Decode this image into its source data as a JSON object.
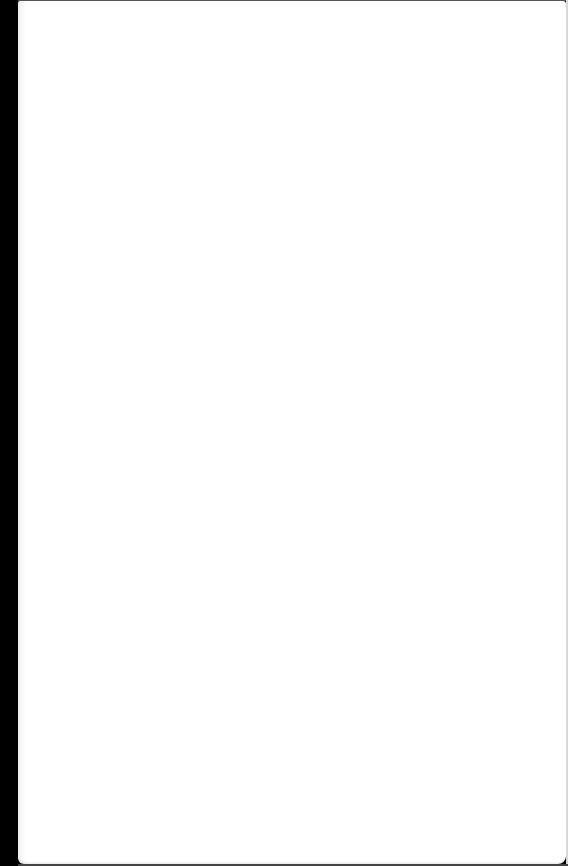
{
  "document": {
    "type": "blank-page",
    "text": "",
    "colors": {
      "page": "#ffffff",
      "background": "#000000"
    }
  }
}
